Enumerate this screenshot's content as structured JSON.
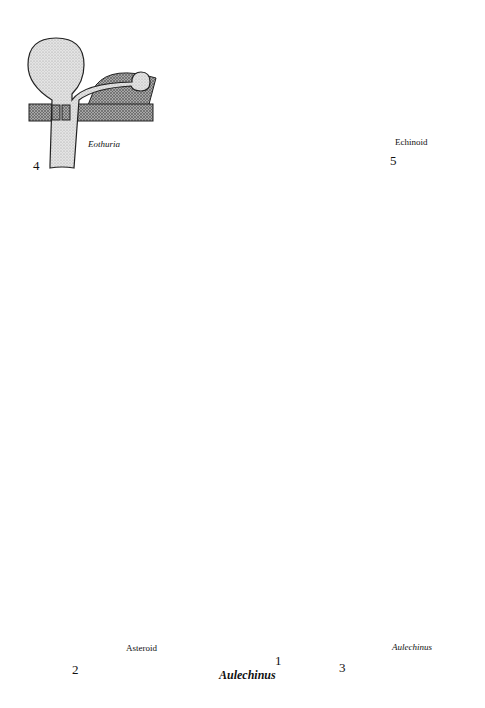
{
  "figure": {
    "main": {
      "number": "1",
      "name": "Aulechinus"
    },
    "insets": [
      {
        "number": "4",
        "name": "Eothuria",
        "position": "top-left"
      },
      {
        "number": "5",
        "name": "Echinoid",
        "position": "top-right"
      },
      {
        "number": "2",
        "name": "Asteroid",
        "position": "bottom-left"
      },
      {
        "number": "3",
        "name": "Aulechinus",
        "position": "bottom-right"
      }
    ]
  },
  "colors": {
    "stipple": "#dcdcdc",
    "crosshatch": "#8a8a8a",
    "outline": "#1a1a1a",
    "background": "#ffffff"
  }
}
